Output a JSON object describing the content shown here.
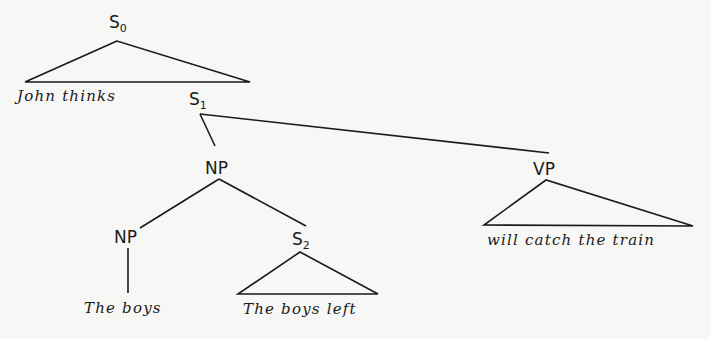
{
  "diagram": {
    "type": "syntax-tree",
    "nodes": {
      "s0": {
        "label": "S",
        "sub": "0"
      },
      "s1": {
        "label": "S",
        "sub": "1"
      },
      "np_top": {
        "label": "NP"
      },
      "vp": {
        "label": "VP"
      },
      "np_inner": {
        "label": "NP"
      },
      "s2": {
        "label": "S",
        "sub": "2"
      }
    },
    "leaves": {
      "s0_text": "John thinks",
      "np_inner_text": "The boys",
      "s2_text": "The boys left",
      "vp_text": "will catch the train"
    },
    "edges": [
      [
        "S0",
        "John thinks (triangle)"
      ],
      [
        "S0",
        "S1"
      ],
      [
        "S1",
        "NP"
      ],
      [
        "S1",
        "VP"
      ],
      [
        "NP",
        "NP"
      ],
      [
        "NP",
        "S2"
      ],
      [
        "NP",
        "The boys"
      ],
      [
        "S2",
        "The boys left (triangle)"
      ],
      [
        "VP",
        "will catch the train (triangle)"
      ]
    ]
  }
}
